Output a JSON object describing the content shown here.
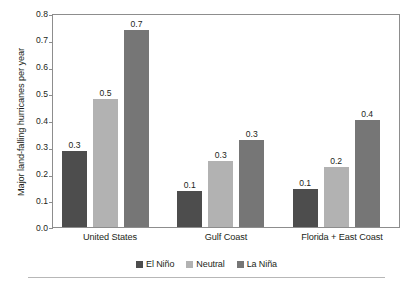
{
  "chart_data": {
    "type": "bar",
    "title": "",
    "xlabel": "",
    "ylabel": "Major land-falling hurricanes per year",
    "categories": [
      "United States",
      "Gulf Coast",
      "Florida + East Coast"
    ],
    "series": [
      {
        "name": "El Niño",
        "color": "#4d4d4d",
        "values": [
          0.283,
          0.135,
          0.141
        ],
        "labels": [
          "0.3",
          "0.1",
          "0.1"
        ]
      },
      {
        "name": "Neutral",
        "color": "#b2b2b2",
        "values": [
          0.48,
          0.245,
          0.225
        ],
        "labels": [
          "0.5",
          "0.3",
          "0.2"
        ]
      },
      {
        "name": "La Niña",
        "color": "#767676",
        "values": [
          0.735,
          0.325,
          0.4
        ],
        "labels": [
          "0.7",
          "0.3",
          "0.4"
        ]
      }
    ],
    "ylim": [
      0.0,
      0.8
    ],
    "ytick_labels": [
      "0.8",
      "0.7",
      "0.6",
      "0.5",
      "0.4",
      "0.3",
      "0.2",
      "0.1",
      "0.0"
    ],
    "ytick_values": [
      0.8,
      0.7,
      0.6,
      0.5,
      0.4,
      0.3,
      0.2,
      0.1,
      0.0
    ],
    "grid": false,
    "legend_position": "bottom-center",
    "frame_color": "#8d8d8d",
    "background": "#ffffff",
    "text_color": "#231f20"
  }
}
